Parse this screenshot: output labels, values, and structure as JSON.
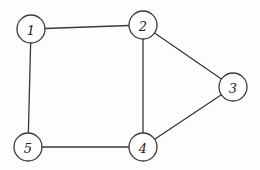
{
  "graph": {
    "nodes": [
      {
        "id": "1",
        "label": "1",
        "x": 31,
        "y": 29,
        "r": 14
      },
      {
        "id": "2",
        "label": "2",
        "x": 143,
        "y": 25,
        "r": 14
      },
      {
        "id": "3",
        "label": "3",
        "x": 233,
        "y": 87,
        "r": 14
      },
      {
        "id": "4",
        "label": "4",
        "x": 143,
        "y": 147,
        "r": 14
      },
      {
        "id": "5",
        "label": "5",
        "x": 28,
        "y": 147,
        "r": 14
      }
    ],
    "edges": [
      {
        "from": "1",
        "to": "2"
      },
      {
        "from": "1",
        "to": "5"
      },
      {
        "from": "2",
        "to": "3"
      },
      {
        "from": "2",
        "to": "4"
      },
      {
        "from": "3",
        "to": "4"
      },
      {
        "from": "4",
        "to": "5"
      }
    ],
    "colors": {
      "stroke": "#3a3a3a",
      "node_fill": "#ffffff",
      "label": "#222222",
      "background": "#fdfdfd"
    }
  }
}
